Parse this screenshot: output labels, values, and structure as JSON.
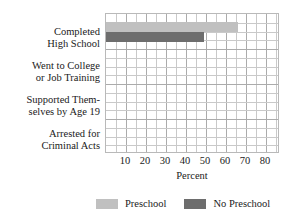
{
  "chart_data": {
    "type": "bar",
    "orientation": "horizontal",
    "title": "",
    "xlabel": "Percent",
    "ylabel": "",
    "xlim": [
      0,
      87
    ],
    "xticks": [
      10,
      20,
      30,
      40,
      50,
      60,
      70,
      80
    ],
    "xtick_labels": [
      "10",
      "20",
      "30",
      "40",
      "50",
      "60",
      "70",
      "80"
    ],
    "grid": true,
    "grid_minor_step": 5,
    "legend_position": "bottom",
    "categories": [
      "Completed High School",
      "Went to College or Job Training",
      "Supported Themselves by Age 19",
      "Arrested for Criminal Acts"
    ],
    "category_lines": [
      [
        "Completed",
        "High School"
      ],
      [
        "Went to College",
        "or Job Training"
      ],
      [
        "Supported Them-",
        "selves by Age 19"
      ],
      [
        "Arrested for",
        "Criminal Acts"
      ]
    ],
    "series": [
      {
        "name": "Preschool",
        "color": "#c0c0c0",
        "values": [
          66,
          0,
          0,
          0
        ]
      },
      {
        "name": "No Preschool",
        "color": "#6d6d6d",
        "values": [
          49,
          0,
          0,
          0
        ]
      }
    ]
  },
  "legend": {
    "entries": [
      {
        "label": "Preschool",
        "swatch": "light"
      },
      {
        "label": "No Preschool",
        "swatch": "dark"
      }
    ]
  },
  "axis": {
    "xlabel": "Percent"
  },
  "colors": {
    "preschool": "#c0c0c0",
    "no_preschool": "#6d6d6d",
    "grid_minor": "#c9c9c9",
    "grid_major": "#ababab",
    "text": "#1a1a1a"
  }
}
